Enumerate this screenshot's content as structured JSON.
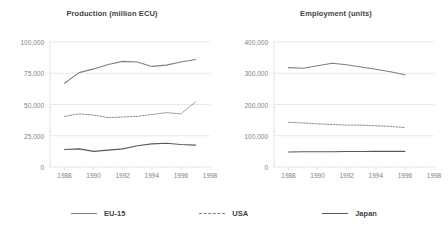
{
  "figure": {
    "background": "#ffffff",
    "axis_color": "#d9d9d9",
    "grid_color": "#d9d9d9",
    "tick_label_color": "#7f7f7f",
    "title_color": "#3f3f3f"
  },
  "legend": {
    "position": "bottom-center",
    "entries": [
      {
        "label": "EU-15",
        "color": "#7f7f7f",
        "dash": "solid"
      },
      {
        "label": "USA",
        "color": "#7f7f7f",
        "dash": "dashed"
      },
      {
        "label": "Japan",
        "color": "#595959",
        "dash": "solid"
      }
    ]
  },
  "chart_data": [
    {
      "type": "line",
      "title": "Production (million ECU)",
      "xlabel": "",
      "ylabel": "",
      "xlim": [
        1987,
        1998
      ],
      "ylim": [
        0,
        100000
      ],
      "yticks": [
        0,
        25000,
        50000,
        75000,
        100000
      ],
      "ytick_labels": [
        "0",
        "25,000",
        "50,000",
        "75,000",
        "100,000"
      ],
      "xticks": [
        1988,
        1990,
        1992,
        1994,
        1996,
        1998
      ],
      "xtick_labels": [
        "1988",
        "1990",
        "1992",
        "1994",
        "1996",
        "1998"
      ],
      "minor_xticks": [
        1987,
        1989,
        1991,
        1993,
        1995,
        1997
      ],
      "grid": "horizontal",
      "x": [
        1988,
        1989,
        1990,
        1991,
        1992,
        1993,
        1994,
        1995,
        1996,
        1997
      ],
      "series": [
        {
          "name": "EU-15",
          "color": "#7f7f7f",
          "dash": "solid",
          "values": [
            67000,
            75500,
            78500,
            82000,
            84500,
            84000,
            80500,
            81500,
            84000,
            86000
          ]
        },
        {
          "name": "USA",
          "color": "#7f7f7f",
          "dash": "dashed",
          "values": [
            40500,
            42500,
            41500,
            39500,
            40000,
            40500,
            42000,
            43500,
            42500,
            47000
          ]
        },
        {
          "name": "Japan",
          "color": "#595959",
          "dash": "solid",
          "values": [
            14000,
            14500,
            12500,
            13500,
            14500,
            17000,
            18500,
            19000,
            18000,
            17500
          ]
        }
      ],
      "series_endpoint_extras": {
        "USA_1997": 52000
      }
    },
    {
      "type": "line",
      "title": "Employment (units)",
      "xlabel": "",
      "ylabel": "",
      "xlim": [
        1987,
        1998
      ],
      "ylim": [
        0,
        400000
      ],
      "yticks": [
        0,
        100000,
        200000,
        300000,
        400000
      ],
      "ytick_labels": [
        "0",
        "100,000",
        "200,000",
        "300,000",
        "400,000"
      ],
      "xticks": [
        1988,
        1990,
        1992,
        1994,
        1996,
        1998
      ],
      "xtick_labels": [
        "1988",
        "1990",
        "1992",
        "1994",
        "1996",
        "1998"
      ],
      "minor_xticks": [
        1987,
        1989,
        1991,
        1993,
        1995,
        1997
      ],
      "grid": "horizontal",
      "x": [
        1988,
        1989,
        1990,
        1991,
        1992,
        1993,
        1994,
        1995,
        1996
      ],
      "series": [
        {
          "name": "EU-15",
          "color": "#7f7f7f",
          "dash": "solid",
          "values": [
            318000,
            316000,
            324000,
            332000,
            327000,
            320000,
            313000,
            305000,
            295000
          ]
        },
        {
          "name": "USA",
          "color": "#7f7f7f",
          "dash": "dashed",
          "values": [
            143000,
            141000,
            138000,
            136000,
            134000,
            134000,
            132000,
            130000,
            126000
          ]
        },
        {
          "name": "Japan",
          "color": "#595959",
          "dash": "solid",
          "values": [
            48000,
            48500,
            49000,
            49000,
            49500,
            49500,
            50000,
            50000,
            50000
          ]
        }
      ]
    }
  ]
}
